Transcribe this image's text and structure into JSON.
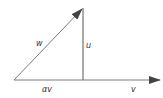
{
  "diagram": {
    "colors": {
      "line": "#6a6a6a",
      "arrow": "#444444",
      "vertical": "#555555",
      "text": "#333333"
    },
    "points": {
      "origin": [
        14,
        80
      ],
      "w_tip": [
        83,
        8
      ],
      "foot": [
        83,
        80
      ],
      "v_tip": [
        160,
        80
      ]
    },
    "labels": {
      "w": "w",
      "u": "u",
      "alpha_v": "αv",
      "v": "v"
    }
  }
}
